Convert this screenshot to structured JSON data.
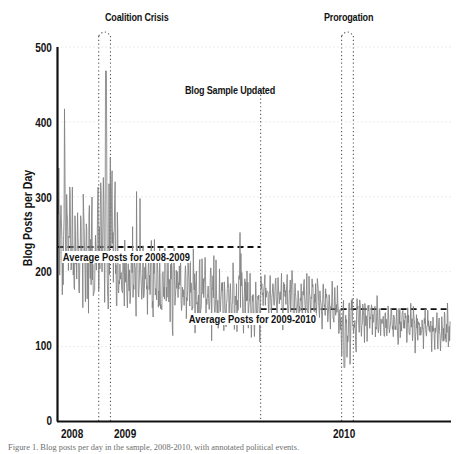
{
  "chart_data": {
    "type": "line",
    "title": "",
    "xlabel": "",
    "ylabel": "Blog Posts per Day",
    "ylim": [
      0,
      500
    ],
    "ytick_labels": [
      "500",
      "400",
      "300",
      "200",
      "100",
      "0"
    ],
    "ytick_values": [
      500,
      400,
      300,
      200,
      100,
      0
    ],
    "xtick_labels": [
      "2008",
      "2009",
      "2010"
    ],
    "xtick_values": [
      2008,
      2009,
      2010
    ],
    "xlim": [
      2007.95,
      2010.62
    ],
    "grid": "horizontal-dotted",
    "legend": "none",
    "series_name": "Blog posts per day",
    "series_color": "#808080",
    "reference_lines": [
      {
        "name": "average-2008-2009",
        "label": "Average Posts for 2008-2009",
        "value": 233,
        "x_start": 2007.95,
        "x_end": 2009.33,
        "style": "dashed",
        "color": "#111111"
      },
      {
        "name": "average-2009-2010",
        "label": "Average Posts for 2009-2010",
        "value": 150,
        "x_start": 2009.33,
        "x_end": 2010.62,
        "style": "dashed",
        "color": "#111111"
      }
    ],
    "annotations": [
      {
        "name": "coalition-crisis",
        "label": "Coalition Crisis",
        "type": "span-bracket",
        "x_start": 2008.23,
        "x_end": 2008.31,
        "label_x": 2008.21,
        "label_y": 512,
        "style": "dotted"
      },
      {
        "name": "blog-sample-updated",
        "label": "Blog Sample Updated",
        "type": "vertical-line",
        "x_start": 2009.33,
        "x_end": 2009.33,
        "label_x": 2009.33,
        "label_y": 452,
        "style": "dotted"
      },
      {
        "name": "prorogation",
        "label": "Prorogation",
        "type": "span-bracket",
        "x_start": 2009.88,
        "x_end": 2009.96,
        "label_x": 2009.86,
        "label_y": 512,
        "style": "dotted"
      }
    ],
    "regimes": [
      {
        "name": "2008 launch",
        "x_start": 2007.95,
        "x_end": 2008.22,
        "mean": 250,
        "volatility": 95
      },
      {
        "name": "coalition crisis spike",
        "x_start": 2008.22,
        "x_end": 2008.36,
        "mean": 235,
        "volatility": 120
      },
      {
        "name": "2009 decline",
        "x_start": 2008.36,
        "x_end": 2009.33,
        "mean": 195,
        "volatility": 60
      },
      {
        "name": "post sample update",
        "x_start": 2009.33,
        "x_end": 2009.87,
        "mean": 172,
        "volatility": 38
      },
      {
        "name": "prorogation dip",
        "x_start": 2009.87,
        "x_end": 2009.98,
        "mean": 125,
        "volatility": 45
      },
      {
        "name": "2010 steady",
        "x_start": 2009.98,
        "x_end": 2010.62,
        "mean": 140,
        "volatility": 32
      }
    ],
    "notable_points": [
      {
        "x": 2008.28,
        "y": 468,
        "note": "peak during Coalition Crisis"
      },
      {
        "x": 2008.05,
        "y": 382,
        "note": "early 2008 high"
      },
      {
        "x": 2009.9,
        "y": 72,
        "note": "low during Prorogation"
      }
    ]
  },
  "caption": {
    "text": "Figure 1. Blog posts per day in the sample, 2008-2010, with annotated political events."
  }
}
